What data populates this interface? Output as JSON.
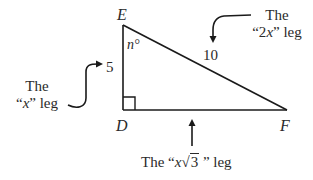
{
  "diagram": {
    "type": "right-triangle",
    "vertices": {
      "E": {
        "label": "E"
      },
      "D": {
        "label": "D"
      },
      "F": {
        "label": "F"
      }
    },
    "angle_label": "n°",
    "sides": {
      "ED": {
        "length_label": "5"
      },
      "EF": {
        "length_label": "10"
      },
      "DF": {
        "length_label": ""
      }
    },
    "right_angle_at": "D",
    "stroke_color": "#1a1a1a"
  },
  "annotations": {
    "x_leg": {
      "line1": "The",
      "line2_open": "“",
      "line2_var": "x",
      "line2_close": "” leg"
    },
    "two_x_leg": {
      "line1": "The",
      "line2_open": "“2",
      "line2_var": "x",
      "line2_close": "” leg"
    },
    "x_root3_leg": {
      "prefix": "The “",
      "var": "x",
      "radical": "√",
      "radicand": "3",
      "suffix": " ” leg"
    }
  }
}
